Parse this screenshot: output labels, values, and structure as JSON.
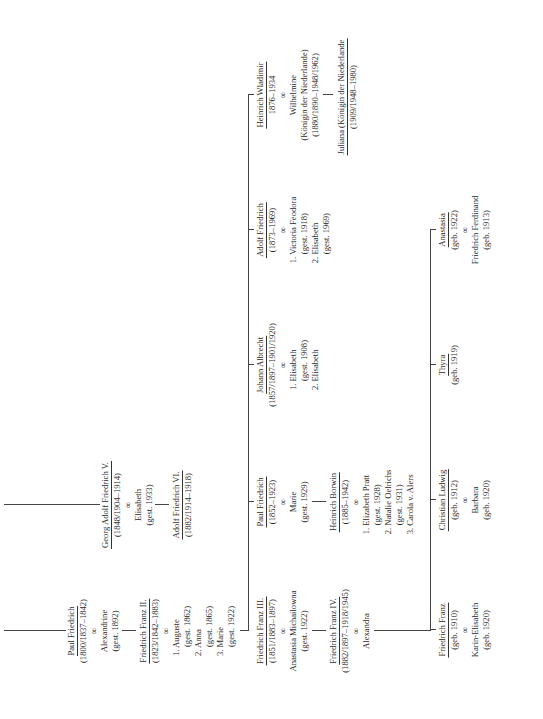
{
  "tree": {
    "paul_friedrich": {
      "name": "Paul Friedrich",
      "dates": "(1800/1837–1842)",
      "marriage_symbol": "∞",
      "spouse": "Alexandrine",
      "spouse_dates": "(gest. 1892)"
    },
    "georg_adolf": {
      "name": "Georg Adolf Friedrich V.",
      "dates": "(1848/1904–1914)",
      "marriage_symbol": "∞",
      "spouse": "Elisabeth",
      "spouse_dates": "(gest. 1933)"
    },
    "adolf_friedrich_vi": {
      "name": "Adolf Friedrich VI.",
      "dates": "(1882/1914–1918)"
    },
    "friedrich_franz_ii": {
      "name": "Friedrich Franz II.",
      "dates": "(1823/1842–1883)",
      "marriage_symbol": "∞",
      "spouses": [
        "1. Auguste",
        "(gest. 1862)",
        "2. Anna",
        "(gest. 1865)",
        "3. Marie",
        "(gest. 1922)"
      ]
    },
    "children_ff2": [
      {
        "name": "Friedrich Franz III.",
        "dates": "(1851/1883–1897)",
        "marriage_symbol": "∞",
        "spouse": "Anastasia Michailowna",
        "spouse_dates": "(gest. 1922)"
      },
      {
        "name": "Paul Friedrich",
        "dates": "(1852–1923)",
        "marriage_symbol": "∞",
        "spouse": "Marie",
        "spouse_dates": "(gest. 1929)"
      },
      {
        "name": "Johann Albrecht",
        "dates": "(1857/1897–1901/1920)",
        "marriage_symbol": "∞",
        "spouses": [
          "1. Elisabeth",
          "(gest. 1908)",
          "2. Elisabeth"
        ]
      },
      {
        "name": "Adolf Friedrich",
        "dates": "(1873–1969)",
        "marriage_symbol": "∞",
        "spouses": [
          "1. Victoria Feodora",
          "(gest. 1918)",
          "2. Elisabeth",
          "(gest. 1969)"
        ]
      },
      {
        "name": "Heinrich Wladimir",
        "dates": "1876–1934",
        "marriage_symbol": "∞",
        "spouse": "Wilhelmine",
        "spouse_title": "(Königin der Niederlande)",
        "spouse_dates": "(1880/1890–1948/1962)"
      }
    ],
    "juliana": {
      "name": "Juliana (Königin der Niederlande",
      "dates": "(1909/1948–1980)"
    },
    "ff4": {
      "name": "Friedrich Franz IV.",
      "dates": "(1882/1897–1918/1945)",
      "marriage_symbol": "∞",
      "spouse": "Alexandra"
    },
    "heinrich_borwin": {
      "name": "Heinrich Borwin",
      "dates": "(1885–1942)",
      "marriage_symbol": "∞",
      "spouses": [
        "1. Elizabeth Pratt",
        "(gest. 1928)",
        "2. Natalie Oelrichs",
        "(gest. 1931)",
        "3. Carola v. Alers"
      ]
    },
    "children_ff4": [
      {
        "name": "Friedrich Franz",
        "dates": "(geb. 1910)",
        "marriage_symbol": "∞",
        "spouse": "Karin-Elisabeth",
        "spouse_dates": "(geb. 1920)"
      },
      {
        "name": "Christian Ludwig",
        "dates": "(geb. 1912)",
        "marriage_symbol": "∞",
        "spouse": "Barbara",
        "spouse_dates": "(geb. 1920)"
      },
      {
        "name": "Thyra",
        "dates": "(geb. 1919)"
      },
      {
        "name": "Anastasia",
        "dates": "(geb. 1922)",
        "marriage_symbol": "∞",
        "spouse": "Friedrich Ferdinand",
        "spouse_dates": "(geb. 1913)"
      }
    ]
  }
}
